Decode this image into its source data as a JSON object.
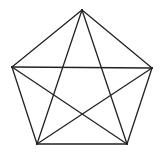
{
  "diagram": {
    "title": "",
    "type": "complete-graph-K5-pentagon-with-diagonals",
    "background": "#ffffff",
    "stroke_color": "#222222",
    "stroke_width": 1.3,
    "vertices": [
      {
        "id": "top",
        "x": 82,
        "y": 10
      },
      {
        "id": "right",
        "x": 152,
        "y": 68
      },
      {
        "id": "bottom-right",
        "x": 127,
        "y": 144
      },
      {
        "id": "bottom-left",
        "x": 37,
        "y": 144
      },
      {
        "id": "left",
        "x": 12,
        "y": 67
      }
    ],
    "edges": [
      {
        "from": "top",
        "to": "right",
        "kind": "side"
      },
      {
        "from": "right",
        "to": "bottom-right",
        "kind": "side"
      },
      {
        "from": "bottom-right",
        "to": "bottom-left",
        "kind": "side"
      },
      {
        "from": "bottom-left",
        "to": "left",
        "kind": "side"
      },
      {
        "from": "left",
        "to": "top",
        "kind": "side"
      },
      {
        "from": "top",
        "to": "bottom-right",
        "kind": "diagonal"
      },
      {
        "from": "top",
        "to": "bottom-left",
        "kind": "diagonal"
      },
      {
        "from": "left",
        "to": "right",
        "kind": "diagonal"
      },
      {
        "from": "left",
        "to": "bottom-right",
        "kind": "diagonal"
      },
      {
        "from": "right",
        "to": "bottom-left",
        "kind": "diagonal"
      }
    ]
  }
}
